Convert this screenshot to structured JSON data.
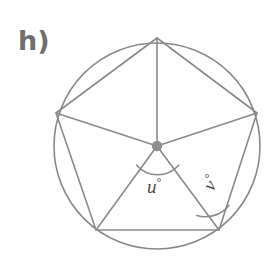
{
  "figure": {
    "part_label": "h)",
    "background_color": "#ffffff",
    "stroke_color": "#8a8a8a",
    "label_color": "#4a4a4a",
    "part_label_color": "#6e6e6e",
    "degree_symbol": "°"
  },
  "circle": {
    "name": "circumscribed-circle",
    "cx": 157,
    "cy": 146,
    "r": 103
  },
  "center_point": {
    "name": "circle-center-dot",
    "cx": 157,
    "cy": 146,
    "r": 5
  },
  "polygon": {
    "name": "inscribed-pentagon",
    "sides": 5,
    "vertices": [
      {
        "id": "top",
        "x": 157,
        "y": 38
      },
      {
        "id": "right",
        "x": 257,
        "y": 113
      },
      {
        "id": "bottom-right",
        "x": 219,
        "y": 230
      },
      {
        "id": "bottom-left",
        "x": 96,
        "y": 230
      },
      {
        "id": "left",
        "x": 56,
        "y": 113
      }
    ]
  },
  "radii": [
    {
      "from": "center",
      "to": "top"
    },
    {
      "from": "center",
      "to": "right"
    },
    {
      "from": "center",
      "to": "bottom-right"
    },
    {
      "from": "center",
      "to": "bottom-left"
    },
    {
      "from": "center",
      "to": "left"
    }
  ],
  "angles": [
    {
      "id": "u",
      "symbol": "u",
      "suffix": "°",
      "text": "u",
      "at_vertex": "center",
      "between": [
        "bottom-left",
        "bottom-right"
      ],
      "arc_radius": 28,
      "label_x": 147,
      "label_y": 176
    },
    {
      "id": "v",
      "symbol": "v",
      "suffix": "°",
      "text": "v",
      "at_vertex": "bottom-right",
      "between": [
        "center",
        "right"
      ],
      "arc_radius": 30,
      "label_x": 198,
      "label_y": 183,
      "rotation_deg": -58
    }
  ]
}
